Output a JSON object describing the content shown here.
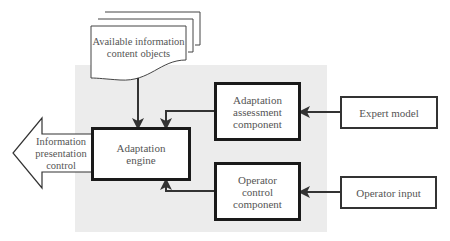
{
  "diagram": {
    "nodes": {
      "content_objects": "Available information\ncontent objects",
      "engine": "Adaptation\nengine",
      "assessment": "Adaptation\nassessment\ncomponent",
      "operator_control": "Operator\ncontrol\ncomponent",
      "expert_model": "Expert model",
      "operator_input": "Operator input",
      "output": "Information\npresentation\ncontrol"
    },
    "edges": [
      {
        "from": "Available information content objects",
        "to": "Adaptation engine"
      },
      {
        "from": "Adaptation assessment component",
        "to": "Adaptation engine"
      },
      {
        "from": "Operator control component",
        "to": "Adaptation engine"
      },
      {
        "from": "Expert model",
        "to": "Adaptation assessment component"
      },
      {
        "from": "Operator input",
        "to": "Operator control component"
      },
      {
        "from": "Adaptation engine",
        "to": "Information presentation control"
      }
    ],
    "colors": {
      "panel": "#ececec",
      "stroke": "#1a1a1a",
      "text": "#555555"
    }
  }
}
